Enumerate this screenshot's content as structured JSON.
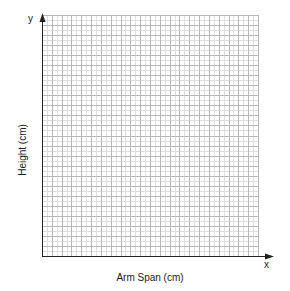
{
  "chart_data": {
    "type": "scatter",
    "title": "",
    "xlabel": "Arm Span (cm)",
    "ylabel": "Height (cm)",
    "x_axis_letter": "x",
    "y_axis_letter": "y",
    "series": [],
    "x": [],
    "values": [],
    "grid": true,
    "grid_columns": 22,
    "grid_rows": 24,
    "tick_labels_x": [],
    "tick_labels_y": [],
    "legend": null,
    "note": "Blank graph-paper grid with no plotted data points or tick labels"
  },
  "style": {
    "axis_color": "#222222",
    "grid_major_color": "#b8b8b8",
    "grid_minor_color": "#dedede",
    "background": "#ffffff"
  },
  "labels": {
    "x_title": "Arm Span (cm)",
    "y_title": "Height (cm)",
    "x_letter": "x",
    "y_letter": "y"
  }
}
